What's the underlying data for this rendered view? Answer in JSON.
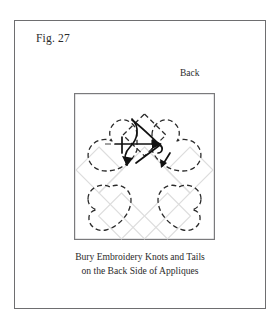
{
  "figure": {
    "label": "Fig. 27",
    "orientation_label": "Back",
    "caption_line_1": "Bury Embroidery Knots and Tails",
    "caption_line_2": "on the Back Side of Appliques"
  },
  "colors": {
    "frame_border": "#6e6e70",
    "block_border": "#7a7a7c",
    "applique_outline": "#2b2b2b",
    "lattice_line": "#d8d8d8",
    "thread_line": "#111111",
    "page_background": "#ffffff"
  },
  "diagram": {
    "block_shape": "square",
    "applique_count": 4,
    "applique_shape": "heart",
    "applique_outline_style": "dashed",
    "center_motif": "diamond",
    "center_motif_outline_style": "dashed",
    "background_grid": "diagonal-lattice",
    "thread_paths": 2,
    "thread_arrow_count": 2,
    "applique_positions": [
      "top-left",
      "top-right",
      "bottom-left",
      "bottom-right"
    ]
  }
}
